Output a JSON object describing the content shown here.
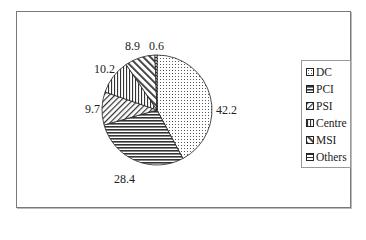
{
  "chart_data": {
    "type": "pie",
    "title": "",
    "categories": [
      "DC",
      "PCI",
      "PSI",
      "Centre",
      "MSI",
      "Others"
    ],
    "values": [
      42.2,
      28.4,
      9.7,
      10.2,
      8.9,
      0.6
    ],
    "labels": [
      "42.2",
      "28.4",
      "9.7",
      "10.2",
      "8.9",
      "0.6"
    ],
    "patterns": [
      "dots",
      "horizontal-lines",
      "diagonal-lines",
      "vertical-lines",
      "wide-diagonal",
      "horizontal-bars"
    ],
    "legend_position": "right",
    "start_angle": "12 o'clock, clockwise"
  },
  "legend": {
    "items": [
      {
        "label": "DC"
      },
      {
        "label": "PCI"
      },
      {
        "label": "PSI"
      },
      {
        "label": "Centre"
      },
      {
        "label": "MSI"
      },
      {
        "label": "Others"
      }
    ]
  }
}
